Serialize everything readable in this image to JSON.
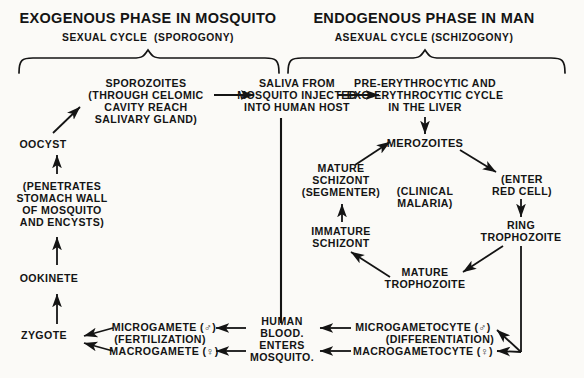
{
  "diagram": {
    "background_color": "#fbfaf7",
    "ink_color": "#141414"
  },
  "headers": [
    {
      "id": "exogenous",
      "main": "EXOGENOUS PHASE IN MOSQUITO",
      "sub": "SEXUAL CYCLE  (SPOROGONY)"
    },
    {
      "id": "endogenous",
      "main": "ENDOGENOUS PHASE IN MAN",
      "sub": "ASEXUAL CYCLE (SCHIZOGONY)"
    }
  ],
  "nodes": {
    "sporozoites": "SPOROZOITES\n(THROUGH CELOMIC\nCAVITY REACH\nSALIVARY GLAND)",
    "saliva": "SALIVA FROM\nMOSQUITO INJECTED\nINTO HUMAN HOST",
    "liver_cycle": "PRE-ERYTHROCYTIC AND\nEXO-ERYTHROCYTIC CYCLE\nIN THE LIVER",
    "oocyst": "OOCYST",
    "penetrates": "(PENETRATES\nSTOMACH WALL\nOF MOSQUITO\nAND ENCYSTS)",
    "ookinete": "OOKINETE",
    "zygote": "ZYGOTE",
    "merozoites": "MEROZOITES",
    "enter_red_cell": "(ENTER\nRED CELL)",
    "ring_trophozoite": "RING\nTROPHOZOITE",
    "mature_trophozoite": "MATURE\nTROPHOZOITE",
    "immature_schizont": "IMMATURE\nSCHIZONT",
    "mature_schizont": "MATURE\nSCHIZONT\n(SEGMENTER)",
    "clinical_malaria": "(CLINICAL\nMALARIA)",
    "microgametocyte": "MICROGAMETOCYTE (♂)",
    "differentiation": "(DIFFERENTIATION)",
    "macrogametocyte": "MACROGAMETOCYTE (♀)",
    "human_blood": "HUMAN\nBLOOD.\nENTERS\nMOSQUITO.",
    "microgamete": "MICROGAMETE (♂)",
    "fertilization": "(FERTILIZATION)",
    "macrogamete": "MACROGAMETE (♀)"
  }
}
